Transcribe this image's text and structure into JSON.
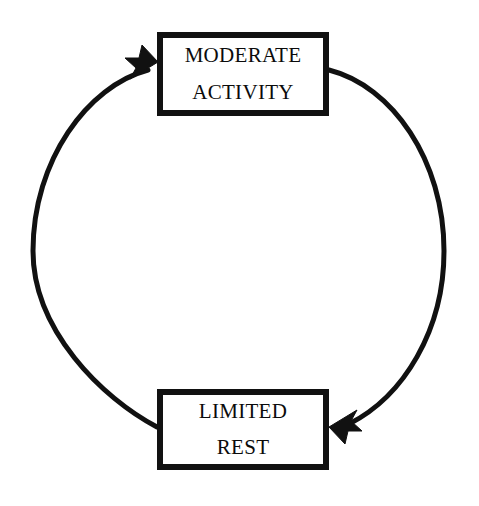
{
  "diagram": {
    "type": "cyclical-flow",
    "direction": "counterclockwise",
    "background_color": "#ffffff",
    "stroke_color": "#111111",
    "text_color": "#0b0b0b",
    "nodes": [
      {
        "id": "moderate-activity",
        "line1": "MODERATE",
        "line2": "ACTIVITY",
        "position": "top"
      },
      {
        "id": "limited-rest",
        "line1": "LIMITED",
        "line2": "REST",
        "position": "bottom"
      }
    ],
    "connectors": [
      {
        "id": "right-arc",
        "from": "moderate-activity",
        "to": "limited-rest",
        "side": "right",
        "arrowhead": "barbed-triangle"
      },
      {
        "id": "left-arc",
        "from": "limited-rest",
        "to": "moderate-activity",
        "side": "left",
        "arrowhead": "barbed-triangle"
      }
    ]
  }
}
